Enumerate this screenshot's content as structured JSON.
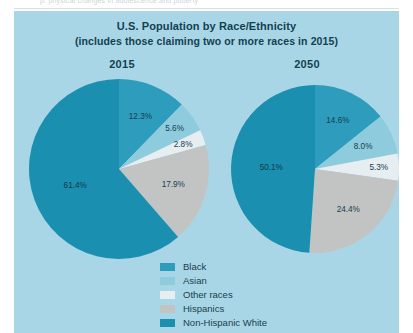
{
  "page_scrap": {
    "text": "p. physical changes in adolescence and puberty"
  },
  "chart_data": {
    "type": "pie",
    "title": "U.S. Population by Race/Ethnicity",
    "subtitle": "(includes those claiming two or more races in 2015)",
    "categories": [
      "Black",
      "Asian",
      "Other races",
      "Hispanics",
      "Non-Hispanic White"
    ],
    "colors": [
      "#2e9cbd",
      "#8ecbdd",
      "#e7eef1",
      "#c2c4c4",
      "#1a8fb0"
    ],
    "legend_position": "bottom-center",
    "grid": false,
    "units": "percent",
    "panels": [
      {
        "title": "2015",
        "values": [
          12.3,
          5.6,
          2.8,
          17.9,
          61.4
        ],
        "labels": [
          "12.3%",
          "5.6%",
          "2.8%",
          "17.9%",
          "61.4%"
        ]
      },
      {
        "title": "2050",
        "values": [
          14.6,
          8.0,
          5.3,
          24.4,
          50.1
        ],
        "labels": [
          "14.6%",
          "8.0%",
          "5.3%",
          "24.4%",
          "50.1%"
        ]
      }
    ]
  },
  "legend": {
    "items": [
      {
        "label": "Black",
        "color": "#2e9cbd"
      },
      {
        "label": "Asian",
        "color": "#8ecbdd"
      },
      {
        "label": "Other races",
        "color": "#e7eef1"
      },
      {
        "label": "Hispanics",
        "color": "#c2c4c4"
      },
      {
        "label": "Non-Hispanic White",
        "color": "#1a8fb0"
      }
    ]
  }
}
